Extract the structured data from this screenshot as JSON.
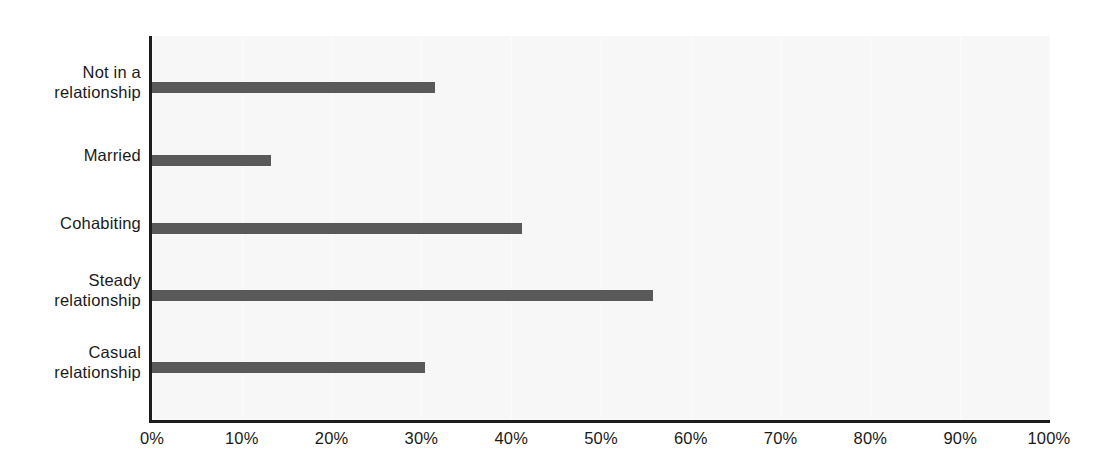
{
  "chart_data": {
    "type": "bar",
    "orientation": "horizontal",
    "title": "",
    "subtitle": "",
    "xlabel": "",
    "ylabel": "",
    "xlim": [
      0,
      100
    ],
    "grid": true,
    "legend": false,
    "bar_color": "#595959",
    "plot_background": "#f7f7f7",
    "axis_color": "#1d1d1d",
    "categories": [
      "Not in a\nrelationship",
      "Married",
      "Cohabiting",
      "Steady\nrelationship",
      "Casual\nrelationship"
    ],
    "values": [
      31.5,
      13.3,
      41.2,
      55.8,
      30.4
    ],
    "value_labels": [
      "31.5%",
      "13.3%",
      "41.2%",
      "55.8%",
      "30.4%"
    ],
    "xticks": [
      0,
      10,
      20,
      30,
      40,
      50,
      60,
      70,
      80,
      90,
      100
    ],
    "xtick_labels": [
      "0%",
      "10%",
      "20%",
      "30%",
      "40%",
      "50%",
      "60%",
      "70%",
      "80%",
      "90%",
      "100%"
    ]
  }
}
